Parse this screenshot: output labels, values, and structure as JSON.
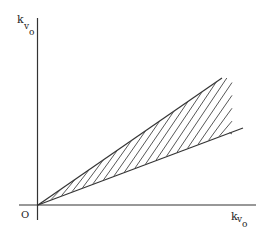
{
  "diagram": {
    "y_axis_label": {
      "main": "k",
      "sub1": "v",
      "sub2": "o"
    },
    "x_axis_label": {
      "main": "k",
      "sub1": "v",
      "sub2": "o"
    },
    "origin_label": "O",
    "colors": {
      "line": "#333333",
      "background": "#ffffff"
    }
  }
}
